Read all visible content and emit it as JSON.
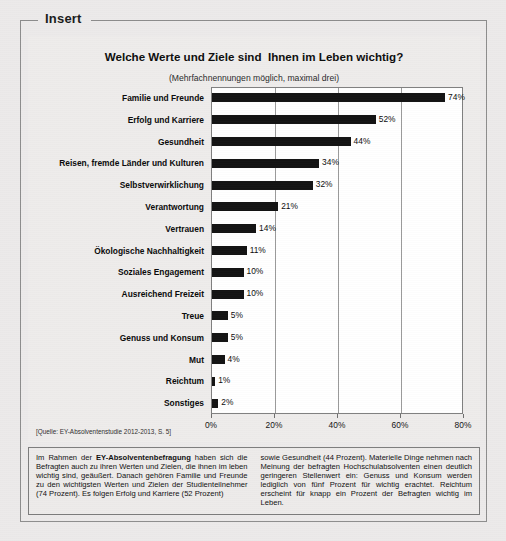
{
  "frame": {
    "label": "Insert"
  },
  "chart_data": {
    "type": "bar",
    "orientation": "horizontal",
    "title": "Welche Werte und Ziele sind  Ihnen im Leben wichtig?",
    "subtitle": "(Mehrfachnennungen möglich, maximal drei)",
    "xlabel": "",
    "ylabel": "",
    "xlim": [
      0,
      80
    ],
    "grid": true,
    "legend": "none",
    "tick_labels": [
      "0%",
      "20%",
      "40%",
      "60%",
      "80%"
    ],
    "tick_values": [
      0,
      20,
      40,
      60,
      80
    ],
    "categories": [
      "Familie und Freunde",
      "Erfolg und Karriere",
      "Gesundheit",
      "Reisen, fremde Länder und Kulturen",
      "Selbstverwirklichung",
      "Verantwortung",
      "Vertrauen",
      "Ökologische Nachhaltigkeit",
      "Soziales Engagement",
      "Ausreichend Freizeit",
      "Treue",
      "Genuss und Konsum",
      "Mut",
      "Reichtum",
      "Sonstiges"
    ],
    "values": [
      74,
      52,
      44,
      34,
      32,
      21,
      14,
      11,
      10,
      10,
      5,
      5,
      4,
      1,
      2
    ],
    "value_labels": [
      "74%",
      "52%",
      "44%",
      "34%",
      "32%",
      "21%",
      "14%",
      "11%",
      "10%",
      "10%",
      "5%",
      "5%",
      "4%",
      "1%",
      "2%"
    ],
    "bar_color": "#131313",
    "plot_background": "#ffffff"
  },
  "source_note": "[Quelle: EY-Absolventenstudie 2012-2013, S. 5]",
  "body_text": {
    "left_pre": "Im Rahmen der ",
    "left_bold": "EY-Absolventenbefragung",
    "left_post": " haben sich die Befragten auch zu ihren Werten und Zielen, die ihnen im leben wichtig sind, geäußert. Danach gehören Familie und Freunde zu den wichtigsten Werten und Zielen der Studienteilnehmer (74 Prozent). Es folgen Erfolg und Karriere (52 Prozent)",
    "right": "sowie Gesundheit (44 Prozent). Materielle Dinge nehmen nach Meinung der befragten Hochschulabsolventen einen deutlich geringeren Stellenwert ein: Genuss und Konsum werden lediglich von fünf Prozent für wichtig erachtet. Reichtum erscheint für knapp ein Prozent der Befragten wichtig im Leben."
  }
}
